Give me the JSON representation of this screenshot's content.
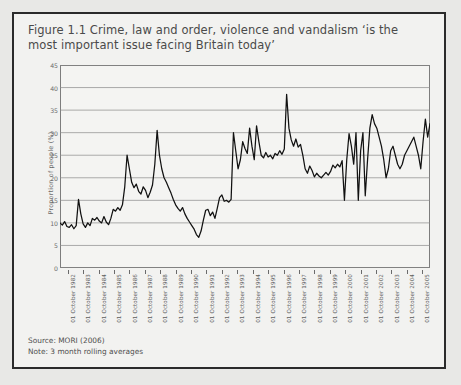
{
  "figure": {
    "title": "Figure 1.1 Crime, law and order, violence and vandalism ‘is the most important issue facing Britain today’",
    "source_line": "Source: MORI (2006)",
    "note_line": "Note: 3 month rolling averages"
  },
  "chart_data": {
    "type": "line",
    "title": "Figure 1.1 Crime, law and order, violence and vandalism ‘is the most important issue facing Britain today’",
    "xlabel": "",
    "ylabel": "Proportion of people (%)",
    "ylim": [
      0,
      45
    ],
    "ytick_labels": [
      "0",
      "5",
      "10",
      "15",
      "20",
      "25",
      "30",
      "35",
      "40",
      "45"
    ],
    "yticks": [
      0,
      5,
      10,
      15,
      20,
      25,
      30,
      35,
      40,
      45
    ],
    "grid": true,
    "legend": "none",
    "series_color": "#111111",
    "x_tick_labels": [
      "01 October 1982",
      "01 October 1983",
      "01 October 1984",
      "01 October 1985",
      "01 October 1986",
      "01 October 1987",
      "01 October 1988",
      "01 October 1989",
      "01 October 1990",
      "01 October 1991",
      "01 October 1992",
      "01 October 1993",
      "01 October 1994",
      "01 October 1995",
      "01 October 1996",
      "01 October 1997",
      "01 October 1998",
      "01 October 1999",
      "01 October 2000",
      "01 October 2001",
      "01 October 2002",
      "01 October 2003",
      "01 October 2004",
      "01 October 2005"
    ],
    "x_range": [
      1982.0,
      2006.0
    ],
    "series": [
      {
        "name": "Crime, law and order, violence and vandalism",
        "x": [
          1982.0,
          1982.15,
          1982.3,
          1982.45,
          1982.6,
          1982.75,
          1982.9,
          1983.05,
          1983.2,
          1983.35,
          1983.5,
          1983.65,
          1983.8,
          1983.95,
          1984.1,
          1984.25,
          1984.4,
          1984.55,
          1984.7,
          1984.85,
          1985.0,
          1985.15,
          1985.3,
          1985.45,
          1985.6,
          1985.75,
          1985.9,
          1986.05,
          1986.2,
          1986.35,
          1986.5,
          1986.65,
          1986.8,
          1986.95,
          1987.1,
          1987.25,
          1987.4,
          1987.55,
          1987.7,
          1987.85,
          1988.0,
          1988.15,
          1988.3,
          1988.45,
          1988.6,
          1988.75,
          1988.9,
          1989.05,
          1989.2,
          1989.35,
          1989.5,
          1989.65,
          1989.8,
          1989.95,
          1990.1,
          1990.25,
          1990.4,
          1990.55,
          1990.7,
          1990.85,
          1991.0,
          1991.15,
          1991.3,
          1991.45,
          1991.6,
          1991.75,
          1991.9,
          1992.05,
          1992.2,
          1992.35,
          1992.5,
          1992.65,
          1992.8,
          1992.95,
          1993.1,
          1993.25,
          1993.4,
          1993.55,
          1993.7,
          1993.85,
          1994.0,
          1994.15,
          1994.3,
          1994.45,
          1994.6,
          1994.75,
          1994.9,
          1995.05,
          1995.2,
          1995.35,
          1995.5,
          1995.65,
          1995.8,
          1995.95,
          1996.1,
          1996.25,
          1996.4,
          1996.55,
          1996.7,
          1996.85,
          1997.0,
          1997.15,
          1997.3,
          1997.45,
          1997.6,
          1997.75,
          1997.9,
          1998.05,
          1998.2,
          1998.35,
          1998.5,
          1998.65,
          1998.8,
          1998.95,
          1999.1,
          1999.25,
          1999.4,
          1999.55,
          1999.7,
          1999.85,
          2000.0,
          2000.15,
          2000.3,
          2000.45,
          2000.6,
          2000.75,
          2000.9,
          2001.05,
          2001.2,
          2001.35,
          2001.5,
          2001.65,
          2001.8,
          2001.95,
          2002.1,
          2002.25,
          2002.4,
          2002.55,
          2002.7,
          2002.85,
          2003.0,
          2003.15,
          2003.3,
          2003.45,
          2003.6,
          2003.75,
          2003.9,
          2004.05,
          2004.2,
          2004.35,
          2004.5,
          2004.65,
          2004.8,
          2004.95,
          2005.1,
          2005.25,
          2005.4,
          2005.55,
          2005.7,
          2005.85,
          2006.0
        ],
        "y": [
          10.0,
          9.5,
          10.3,
          9.2,
          9.0,
          9.6,
          8.7,
          9.4,
          15.2,
          12.0,
          9.8,
          9.0,
          10.0,
          9.4,
          11.0,
          10.6,
          11.2,
          10.4,
          10.0,
          11.4,
          10.2,
          9.6,
          11.0,
          13.0,
          12.6,
          13.4,
          12.8,
          14.0,
          18.0,
          25.0,
          22.0,
          19.0,
          17.8,
          18.6,
          17.0,
          16.4,
          18.0,
          17.2,
          15.6,
          16.8,
          18.4,
          23.0,
          30.5,
          25.0,
          22.0,
          20.0,
          19.0,
          17.8,
          16.6,
          15.2,
          14.0,
          13.2,
          12.6,
          13.4,
          12.0,
          11.0,
          10.2,
          9.4,
          8.6,
          7.4,
          6.8,
          8.2,
          10.6,
          12.8,
          13.0,
          11.6,
          12.4,
          11.0,
          13.2,
          15.6,
          16.2,
          14.8,
          15.0,
          14.6,
          15.2,
          30.0,
          26.0,
          22.0,
          24.0,
          28.0,
          26.5,
          25.4,
          31.0,
          27.0,
          24.0,
          31.5,
          28.0,
          25.0,
          24.4,
          25.6,
          24.6,
          25.0,
          24.2,
          25.4,
          25.0,
          26.0,
          25.2,
          26.4,
          38.5,
          31.0,
          28.4,
          27.0,
          28.6,
          26.8,
          27.4,
          25.0,
          22.0,
          21.0,
          22.6,
          21.6,
          20.2,
          21.0,
          20.4,
          20.0,
          20.6,
          21.2,
          20.6,
          21.4,
          22.8,
          22.2,
          23.0,
          22.4,
          23.8,
          15.0,
          24.0,
          29.8,
          27.0,
          23.0,
          30.0,
          15.0,
          26.0,
          30.0,
          16.0,
          24.0,
          31.0,
          34.0,
          32.0,
          31.0,
          29.0,
          27.0,
          24.0,
          20.0,
          22.0,
          26.0,
          27.0,
          25.0,
          23.0,
          22.0,
          23.0,
          25.0,
          26.0,
          27.0,
          28.0,
          29.0,
          27.0,
          25.0,
          22.0,
          28.0,
          33.0,
          29.0,
          32.0
        ]
      }
    ]
  }
}
